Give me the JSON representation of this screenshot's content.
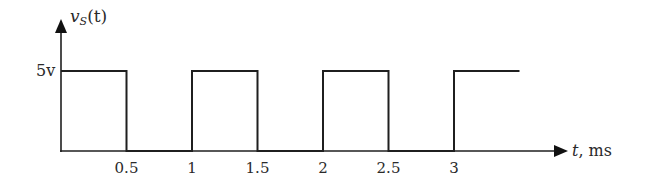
{
  "chart_data": {
    "type": "line",
    "title": "",
    "ylabel": "v_S(t)",
    "ylabel_main": "v",
    "ylabel_sub": "S",
    "ylabel_arg": "(t)",
    "xlabel_var": "t",
    "xlabel_unit": ", ms",
    "y_level_label": "5v",
    "x_ticks": [
      "0.5",
      "1",
      "1.5",
      "2",
      "2.5",
      "3"
    ],
    "x": [
      0,
      0.5,
      0.5,
      1,
      1,
      1.5,
      1.5,
      2,
      2,
      2.5,
      2.5,
      3,
      3,
      3.5
    ],
    "values": [
      5,
      5,
      0,
      0,
      5,
      5,
      0,
      0,
      5,
      5,
      0,
      0,
      5,
      5
    ],
    "xlim": [
      0,
      3.85
    ],
    "ylim": [
      0,
      6.5
    ],
    "grid": false,
    "legend": "none"
  },
  "colors": {
    "line": "#1f1f1f",
    "text": "#2a2a2a",
    "background": "#ffffff"
  }
}
